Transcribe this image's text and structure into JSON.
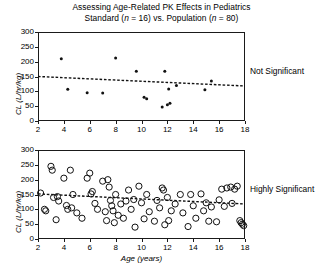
{
  "figure": {
    "title_line1": "Assessing Age-Related PK Effects in Pediatrics",
    "subtitle_prefix": "Standard (",
    "subtitle_n1": "n",
    "subtitle_mid": " = 16) vs. Population (",
    "subtitle_n2": "n",
    "subtitle_suffix": " = 80)"
  },
  "chart_data": [
    {
      "type": "scatter",
      "panel": "top",
      "title": "Standard (n = 16)",
      "annotation": "Not Significant",
      "xlabel": "",
      "ylabel": "CL (L/hr/kg)",
      "xlim": [
        2,
        18
      ],
      "ylim": [
        0,
        300
      ],
      "xticks": [
        2,
        4,
        6,
        8,
        10,
        12,
        14,
        16,
        18
      ],
      "yticks": [
        0,
        50,
        100,
        150,
        200,
        250,
        300
      ],
      "grid": false,
      "marker": "filled-circle",
      "n": 16,
      "points": [
        {
          "x": 3.8,
          "y": 210
        },
        {
          "x": 4.3,
          "y": 107
        },
        {
          "x": 5.8,
          "y": 95
        },
        {
          "x": 7.0,
          "y": 94
        },
        {
          "x": 8.0,
          "y": 212
        },
        {
          "x": 9.6,
          "y": 168
        },
        {
          "x": 10.2,
          "y": 80
        },
        {
          "x": 10.4,
          "y": 75
        },
        {
          "x": 11.6,
          "y": 47
        },
        {
          "x": 11.8,
          "y": 168
        },
        {
          "x": 12.0,
          "y": 55
        },
        {
          "x": 12.1,
          "y": 108
        },
        {
          "x": 12.2,
          "y": 60
        },
        {
          "x": 12.7,
          "y": 120
        },
        {
          "x": 14.9,
          "y": 105
        },
        {
          "x": 15.4,
          "y": 135
        }
      ],
      "trend_line": {
        "x0": 2,
        "y0": 150,
        "x1": 18,
        "y1": 118,
        "style": "dashed"
      }
    },
    {
      "type": "scatter",
      "panel": "bottom",
      "title": "Population (n = 80)",
      "annotation": "Highly Significant",
      "xlabel": "Age (years)",
      "ylabel": "CL (L/hr/kg)",
      "xlim": [
        2,
        18
      ],
      "ylim": [
        0,
        300
      ],
      "xticks": [
        2,
        4,
        6,
        8,
        10,
        12,
        14,
        16,
        18
      ],
      "yticks": [
        0,
        50,
        100,
        150,
        200,
        250,
        300
      ],
      "grid": false,
      "marker": "open-circle",
      "n": 80,
      "points": [
        {
          "x": 2.2,
          "y": 155
        },
        {
          "x": 2.5,
          "y": 100
        },
        {
          "x": 2.6,
          "y": 95
        },
        {
          "x": 3.0,
          "y": 245
        },
        {
          "x": 3.1,
          "y": 232
        },
        {
          "x": 3.2,
          "y": 140
        },
        {
          "x": 3.4,
          "y": 65
        },
        {
          "x": 3.5,
          "y": 143
        },
        {
          "x": 3.6,
          "y": 128
        },
        {
          "x": 4.0,
          "y": 205
        },
        {
          "x": 4.2,
          "y": 113
        },
        {
          "x": 4.3,
          "y": 100
        },
        {
          "x": 4.5,
          "y": 232
        },
        {
          "x": 4.6,
          "y": 105
        },
        {
          "x": 4.7,
          "y": 150
        },
        {
          "x": 5.0,
          "y": 88
        },
        {
          "x": 5.4,
          "y": 70
        },
        {
          "x": 5.8,
          "y": 205
        },
        {
          "x": 6.0,
          "y": 222
        },
        {
          "x": 6.1,
          "y": 152
        },
        {
          "x": 6.2,
          "y": 160
        },
        {
          "x": 6.4,
          "y": 120
        },
        {
          "x": 6.6,
          "y": 100
        },
        {
          "x": 7.0,
          "y": 195
        },
        {
          "x": 7.2,
          "y": 92
        },
        {
          "x": 7.3,
          "y": 62
        },
        {
          "x": 7.4,
          "y": 200
        },
        {
          "x": 7.5,
          "y": 175
        },
        {
          "x": 7.6,
          "y": 130
        },
        {
          "x": 7.7,
          "y": 112
        },
        {
          "x": 7.8,
          "y": 95
        },
        {
          "x": 7.9,
          "y": 55
        },
        {
          "x": 8.0,
          "y": 150
        },
        {
          "x": 8.2,
          "y": 80
        },
        {
          "x": 8.4,
          "y": 118
        },
        {
          "x": 8.6,
          "y": 70
        },
        {
          "x": 8.8,
          "y": 128
        },
        {
          "x": 9.0,
          "y": 165
        },
        {
          "x": 9.2,
          "y": 100
        },
        {
          "x": 9.4,
          "y": 133
        },
        {
          "x": 9.5,
          "y": 40
        },
        {
          "x": 9.8,
          "y": 178
        },
        {
          "x": 10.0,
          "y": 122
        },
        {
          "x": 10.2,
          "y": 68
        },
        {
          "x": 10.4,
          "y": 150
        },
        {
          "x": 10.6,
          "y": 92
        },
        {
          "x": 11.0,
          "y": 60
        },
        {
          "x": 11.2,
          "y": 130
        },
        {
          "x": 11.4,
          "y": 105
        },
        {
          "x": 11.6,
          "y": 172
        },
        {
          "x": 11.7,
          "y": 165
        },
        {
          "x": 11.8,
          "y": 48
        },
        {
          "x": 12.0,
          "y": 140
        },
        {
          "x": 12.1,
          "y": 62
        },
        {
          "x": 12.3,
          "y": 95
        },
        {
          "x": 12.6,
          "y": 118
        },
        {
          "x": 13.0,
          "y": 150
        },
        {
          "x": 13.2,
          "y": 88
        },
        {
          "x": 13.6,
          "y": 42
        },
        {
          "x": 13.8,
          "y": 150
        },
        {
          "x": 14.0,
          "y": 112
        },
        {
          "x": 14.2,
          "y": 70
        },
        {
          "x": 14.6,
          "y": 152
        },
        {
          "x": 14.8,
          "y": 95
        },
        {
          "x": 15.0,
          "y": 122
        },
        {
          "x": 15.2,
          "y": 60
        },
        {
          "x": 15.4,
          "y": 108
        },
        {
          "x": 15.8,
          "y": 58
        },
        {
          "x": 16.0,
          "y": 132
        },
        {
          "x": 16.2,
          "y": 168
        },
        {
          "x": 16.4,
          "y": 110
        },
        {
          "x": 16.6,
          "y": 172
        },
        {
          "x": 16.9,
          "y": 175
        },
        {
          "x": 17.0,
          "y": 120
        },
        {
          "x": 17.2,
          "y": 168
        },
        {
          "x": 17.4,
          "y": 178
        },
        {
          "x": 17.6,
          "y": 62
        },
        {
          "x": 17.7,
          "y": 55
        },
        {
          "x": 17.8,
          "y": 50
        },
        {
          "x": 17.9,
          "y": 45
        }
      ],
      "trend_line": {
        "x0": 2,
        "y0": 152,
        "x1": 18,
        "y1": 118,
        "style": "dashed"
      }
    }
  ]
}
